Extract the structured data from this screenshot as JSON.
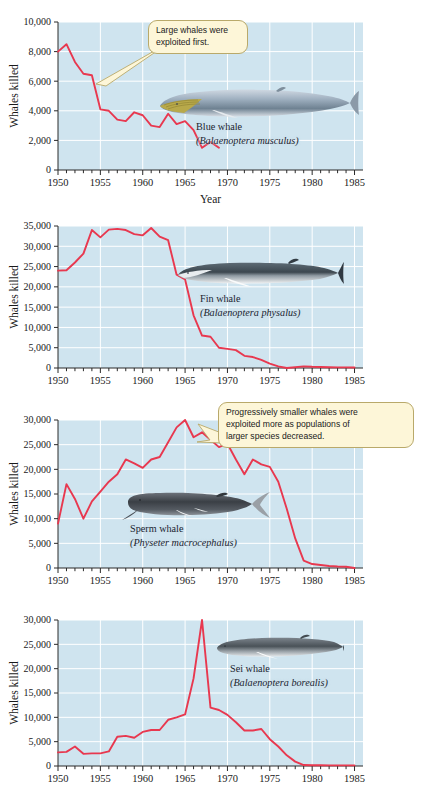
{
  "figure": {
    "background": "#ffffff",
    "plot_bg": "#cfe4ef",
    "grid_color": "#ffffff",
    "line_color": "#e8384f",
    "callout_bg": "#fdf6d8",
    "callout_border": "#b9a96a"
  },
  "callouts": [
    {
      "id": "callout-large-whales",
      "text": "Large whales were\nexploited first."
    },
    {
      "id": "callout-smaller-whales",
      "text": "Progressively smaller whales were\nexploited more as  populations of\nlarger species decreased."
    }
  ],
  "species": [
    {
      "common": "Blue whale",
      "scientific": "(Balaenoptera musculus)"
    },
    {
      "common": "Fin whale",
      "scientific": "(Balaenoptera physalus)"
    },
    {
      "common": "Sperm whale",
      "scientific": "(Physeter macrocephalus)"
    },
    {
      "common": "Sei whale",
      "scientific": "(Balaenoptera borealis)"
    }
  ],
  "chart_data": [
    {
      "type": "line",
      "title": "Blue whale",
      "xlabel": "Year",
      "ylabel": "Whales killed",
      "xlim": [
        1950,
        1986
      ],
      "ylim": [
        0,
        10000
      ],
      "yticks": [
        0,
        2000,
        4000,
        6000,
        8000,
        10000
      ],
      "ytick_labels": [
        "0",
        "2,000",
        "4,000",
        "6,000",
        "8,000",
        "10,000"
      ],
      "xticks": [
        1950,
        1955,
        1960,
        1965,
        1970,
        1975,
        1980,
        1985
      ],
      "xtick_labels": [
        "1950",
        "1955",
        "1960",
        "1965",
        "1970",
        "1975",
        "1980",
        "1985"
      ],
      "grid": true,
      "legend": "none",
      "x": [
        1950,
        1951,
        1952,
        1953,
        1954,
        1955,
        1956,
        1957,
        1958,
        1959,
        1960,
        1961,
        1962,
        1963,
        1964,
        1965,
        1966,
        1967,
        1968,
        1969,
        1970,
        1971,
        1972,
        1973,
        1974,
        1975,
        1976,
        1977,
        1978,
        1979,
        1980,
        1981,
        1982,
        1983,
        1984,
        1985
      ],
      "values": [
        8000,
        8500,
        7300,
        6500,
        6400,
        4100,
        4000,
        3400,
        3300,
        3900,
        3700,
        3000,
        2900,
        3800,
        3100,
        3300,
        2700,
        1500,
        1900,
        1500,
        1300,
        0,
        0,
        0,
        0,
        0,
        0,
        0,
        0,
        0,
        0,
        0,
        0,
        0,
        0,
        0
      ],
      "series_end_year": 1969
    },
    {
      "type": "line",
      "title": "Fin whale",
      "xlabel": "",
      "ylabel": "Whales killed",
      "xlim": [
        1950,
        1986
      ],
      "ylim": [
        0,
        35000
      ],
      "yticks": [
        0,
        5000,
        10000,
        15000,
        20000,
        25000,
        30000,
        35000
      ],
      "ytick_labels": [
        "0",
        "5,000",
        "10,000",
        "15,000",
        "20,000",
        "25,000",
        "30,000",
        "35,000"
      ],
      "xticks": [
        1950,
        1955,
        1960,
        1965,
        1970,
        1975,
        1980,
        1985
      ],
      "xtick_labels": [
        "1950",
        "1955",
        "1960",
        "1965",
        "1970",
        "1975",
        "1980",
        "1985"
      ],
      "grid": true,
      "legend": "none",
      "x": [
        1950,
        1951,
        1952,
        1953,
        1954,
        1955,
        1956,
        1957,
        1958,
        1959,
        1960,
        1961,
        1962,
        1963,
        1964,
        1965,
        1966,
        1967,
        1968,
        1969,
        1970,
        1971,
        1972,
        1973,
        1974,
        1975,
        1976,
        1977,
        1978,
        1979,
        1980,
        1981,
        1982,
        1983,
        1984,
        1985
      ],
      "values": [
        24000,
        24100,
        26000,
        28200,
        34000,
        32200,
        34100,
        34300,
        34000,
        33000,
        32700,
        34500,
        32400,
        31500,
        23000,
        21800,
        13000,
        8000,
        7700,
        5000,
        4700,
        4400,
        3000,
        2700,
        2000,
        1100,
        400,
        0,
        200,
        400,
        300,
        250,
        200,
        150,
        150,
        120
      ]
    },
    {
      "type": "line",
      "title": "Sperm whale",
      "xlabel": "",
      "ylabel": "Whales killed",
      "xlim": [
        1950,
        1986
      ],
      "ylim": [
        0,
        30000
      ],
      "yticks": [
        0,
        5000,
        10000,
        15000,
        20000,
        25000,
        30000
      ],
      "ytick_labels": [
        "0",
        "5,000",
        "10,000",
        "15,000",
        "20,000",
        "25,000",
        "30,000"
      ],
      "xticks": [
        1950,
        1955,
        1960,
        1965,
        1970,
        1975,
        1980,
        1985
      ],
      "xtick_labels": [
        "1950",
        "1955",
        "1960",
        "1965",
        "1970",
        "1975",
        "1980",
        "1985"
      ],
      "grid": true,
      "legend": "none",
      "x": [
        1950,
        1951,
        1952,
        1953,
        1954,
        1955,
        1956,
        1957,
        1958,
        1959,
        1960,
        1961,
        1962,
        1963,
        1964,
        1965,
        1966,
        1967,
        1968,
        1969,
        1970,
        1971,
        1972,
        1973,
        1974,
        1975,
        1976,
        1977,
        1978,
        1979,
        1980,
        1981,
        1982,
        1983,
        1984,
        1985
      ],
      "values": [
        9000,
        17000,
        14000,
        10000,
        13500,
        15500,
        17500,
        19000,
        22000,
        21200,
        20300,
        22000,
        22500,
        25500,
        28500,
        30000,
        26500,
        27500,
        26000,
        24500,
        25200,
        22000,
        19000,
        22000,
        21000,
        20500,
        17500,
        12000,
        6000,
        1500,
        800,
        600,
        400,
        300,
        250,
        0
      ]
    },
    {
      "type": "line",
      "title": "Sei whale",
      "xlabel": "",
      "ylabel": "Whales killed",
      "xlim": [
        1950,
        1986
      ],
      "ylim": [
        0,
        30000
      ],
      "yticks": [
        0,
        5000,
        10000,
        15000,
        20000,
        25000,
        30000
      ],
      "ytick_labels": [
        "0",
        "5,000",
        "10,000",
        "15,000",
        "20,000",
        "25,000",
        "30,000"
      ],
      "xticks": [
        1950,
        1955,
        1960,
        1965,
        1970,
        1975,
        1980,
        1985
      ],
      "xtick_labels": [
        "1950",
        "1955",
        "1960",
        "1965",
        "1970",
        "1975",
        "1980",
        "1985"
      ],
      "grid": true,
      "legend": "none",
      "x": [
        1950,
        1951,
        1952,
        1953,
        1954,
        1955,
        1956,
        1957,
        1958,
        1959,
        1960,
        1961,
        1962,
        1963,
        1964,
        1965,
        1966,
        1967,
        1968,
        1969,
        1970,
        1971,
        1972,
        1973,
        1974,
        1975,
        1976,
        1977,
        1978,
        1979,
        1980,
        1981,
        1982,
        1983,
        1984,
        1985
      ],
      "values": [
        2800,
        2900,
        4000,
        2500,
        2600,
        2600,
        3000,
        6000,
        6200,
        5800,
        7000,
        7400,
        7400,
        9500,
        10000,
        10600,
        18000,
        30000,
        12000,
        11500,
        10500,
        9000,
        7300,
        7300,
        7600,
        5500,
        4000,
        2200,
        900,
        200,
        150,
        150,
        120,
        120,
        120,
        120
      ]
    }
  ]
}
